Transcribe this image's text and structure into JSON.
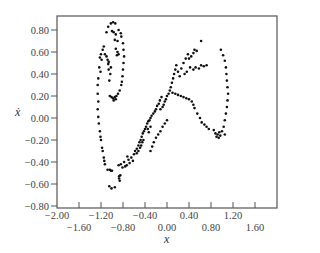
{
  "chart_data": {
    "type": "scatter",
    "title": "",
    "xlabel": "x",
    "ylabel": "ẋ",
    "xlim": [
      -2.0,
      2.0
    ],
    "ylim": [
      -0.8,
      0.9
    ],
    "grid": false,
    "legend": null,
    "x_ticks": [
      -2.0,
      -1.6,
      -1.2,
      -0.8,
      -0.4,
      0.0,
      0.4,
      0.8,
      1.2,
      1.6
    ],
    "x_tick_labels": [
      "−2.00",
      "−1.60",
      "−1.20",
      "−0.80",
      "−0.40",
      "0.00",
      "0.40",
      "0.80",
      "1.20",
      "1.60"
    ],
    "y_ticks": [
      0.8,
      0.6,
      0.4,
      0.2,
      0.0,
      -0.2,
      -0.4,
      -0.6,
      -0.8
    ],
    "y_tick_labels": [
      "0.80",
      "0.60",
      "0.40",
      "0.20",
      "0.00",
      "−0.20",
      "−0.40",
      "−0.60",
      "−0.80"
    ],
    "marker_color": "#111111",
    "series": [
      {
        "name": "phase trajectory",
        "points": [
          [
            -1.02,
            0.86
          ],
          [
            -0.98,
            0.87
          ],
          [
            -0.94,
            0.86
          ],
          [
            -1.07,
            0.83
          ],
          [
            -1.1,
            0.78
          ],
          [
            -1.0,
            0.79
          ],
          [
            -0.97,
            0.78
          ],
          [
            -0.93,
            0.76
          ],
          [
            -0.88,
            0.8
          ],
          [
            -0.84,
            0.77
          ],
          [
            -0.83,
            0.74
          ],
          [
            -0.95,
            0.71
          ],
          [
            -0.9,
            0.7
          ],
          [
            -0.8,
            0.68
          ],
          [
            -0.79,
            0.62
          ],
          [
            -0.78,
            0.56
          ],
          [
            -0.79,
            0.5
          ],
          [
            -0.8,
            0.44
          ],
          [
            -0.81,
            0.38
          ],
          [
            -0.82,
            0.33
          ],
          [
            -0.83,
            0.3
          ],
          [
            -0.86,
            0.25
          ],
          [
            -0.89,
            0.22
          ],
          [
            -0.92,
            0.2
          ],
          [
            -0.95,
            0.19
          ],
          [
            -0.98,
            0.18
          ],
          [
            -1.01,
            0.19
          ],
          [
            -1.04,
            0.2
          ],
          [
            -0.97,
            0.16
          ],
          [
            -0.93,
            0.17
          ],
          [
            -1.05,
            0.34
          ],
          [
            -1.03,
            0.4
          ],
          [
            -1.06,
            0.44
          ],
          [
            -1.02,
            0.46
          ],
          [
            -1.07,
            0.49
          ],
          [
            -0.93,
            0.63
          ],
          [
            -0.9,
            0.6
          ],
          [
            -0.91,
            0.57
          ],
          [
            -0.88,
            0.58
          ],
          [
            -1.13,
            0.58
          ],
          [
            -1.1,
            0.56
          ],
          [
            -1.08,
            0.53
          ],
          [
            -1.06,
            0.51
          ],
          [
            -1.17,
            0.62
          ],
          [
            -1.2,
            0.58
          ],
          [
            -1.22,
            0.55
          ],
          [
            -1.19,
            0.53
          ],
          [
            -1.15,
            0.65
          ],
          [
            -1.23,
            0.46
          ],
          [
            -1.21,
            0.42
          ],
          [
            -1.25,
            0.36
          ],
          [
            -1.26,
            0.3
          ],
          [
            -1.26,
            0.22
          ],
          [
            -1.25,
            0.15
          ],
          [
            -1.26,
            0.08
          ],
          [
            -1.25,
            0.01
          ],
          [
            -1.24,
            -0.05
          ],
          [
            -1.22,
            -0.12
          ],
          [
            -1.21,
            -0.17
          ],
          [
            -1.2,
            -0.2
          ],
          [
            -1.18,
            -0.27
          ],
          [
            -1.17,
            -0.3
          ],
          [
            -1.15,
            -0.36
          ],
          [
            -1.14,
            -0.39
          ],
          [
            -1.13,
            -0.42
          ],
          [
            -1.08,
            -0.47
          ],
          [
            -1.04,
            -0.47
          ],
          [
            -1.02,
            -0.48
          ],
          [
            -1.0,
            -0.48
          ],
          [
            -1.05,
            -0.62
          ],
          [
            -1.01,
            -0.64
          ],
          [
            -0.95,
            -0.63
          ],
          [
            -0.87,
            -0.53
          ],
          [
            -0.87,
            -0.55
          ],
          [
            -0.86,
            -0.57
          ],
          [
            -0.85,
            -0.52
          ],
          [
            -0.88,
            -0.43
          ],
          [
            -0.84,
            -0.42
          ],
          [
            -0.81,
            -0.45
          ],
          [
            -0.78,
            -0.4
          ],
          [
            -0.76,
            -0.44
          ],
          [
            -0.73,
            -0.43
          ],
          [
            -0.7,
            -0.38
          ],
          [
            -0.72,
            -0.35
          ],
          [
            -0.68,
            -0.41
          ],
          [
            -0.65,
            -0.36
          ],
          [
            -0.62,
            -0.39
          ],
          [
            -0.6,
            -0.33
          ],
          [
            -0.58,
            -0.3
          ],
          [
            -0.55,
            -0.28
          ],
          [
            -0.52,
            -0.25
          ],
          [
            -0.5,
            -0.22
          ],
          [
            -0.48,
            -0.2
          ],
          [
            -0.46,
            -0.17
          ],
          [
            -0.44,
            -0.14
          ],
          [
            -0.42,
            -0.12
          ],
          [
            -0.4,
            -0.1
          ],
          [
            -0.55,
            -0.32
          ],
          [
            -0.52,
            -0.3
          ],
          [
            -0.49,
            -0.27
          ],
          [
            -0.47,
            -0.25
          ],
          [
            -0.45,
            -0.22
          ],
          [
            -0.43,
            -0.2
          ],
          [
            -0.38,
            -0.08
          ],
          [
            -0.36,
            -0.05
          ],
          [
            -0.34,
            -0.03
          ],
          [
            -0.32,
            -0.02
          ],
          [
            -0.3,
            0.0
          ],
          [
            -0.28,
            0.02
          ],
          [
            -0.35,
            -0.1
          ],
          [
            -0.33,
            -0.13
          ],
          [
            -0.3,
            -0.08
          ],
          [
            -0.25,
            0.04
          ],
          [
            -0.22,
            0.06
          ],
          [
            -0.2,
            0.08
          ],
          [
            -0.18,
            0.11
          ],
          [
            -0.15,
            0.13
          ],
          [
            -0.13,
            0.16
          ],
          [
            -0.1,
            0.19
          ],
          [
            -0.12,
            0.08
          ],
          [
            -0.08,
            0.1
          ],
          [
            -0.06,
            0.12
          ],
          [
            -0.04,
            0.15
          ],
          [
            -0.02,
            0.17
          ],
          [
            0.0,
            0.2
          ],
          [
            0.03,
            0.22
          ],
          [
            0.05,
            0.25
          ],
          [
            0.07,
            0.28
          ],
          [
            0.09,
            0.32
          ],
          [
            0.11,
            0.36
          ],
          [
            0.13,
            0.4
          ],
          [
            0.15,
            0.44
          ],
          [
            0.17,
            0.48
          ],
          [
            0.2,
            0.42
          ],
          [
            0.23,
            0.38
          ],
          [
            0.26,
            0.45
          ],
          [
            0.3,
            0.5
          ],
          [
            0.34,
            0.54
          ],
          [
            0.38,
            0.58
          ],
          [
            0.4,
            0.54
          ],
          [
            0.44,
            0.56
          ],
          [
            0.48,
            0.59
          ],
          [
            0.54,
            0.61
          ],
          [
            0.62,
            0.7
          ],
          [
            0.5,
            0.62
          ],
          [
            0.32,
            0.4
          ],
          [
            0.36,
            0.42
          ],
          [
            0.42,
            0.46
          ],
          [
            0.48,
            0.44
          ],
          [
            0.52,
            0.46
          ],
          [
            0.58,
            0.45
          ],
          [
            0.62,
            0.48
          ],
          [
            0.67,
            0.47
          ],
          [
            0.72,
            0.48
          ],
          [
            0.1,
            0.23
          ],
          [
            0.15,
            0.22
          ],
          [
            0.2,
            0.21
          ],
          [
            0.25,
            0.2
          ],
          [
            0.3,
            0.19
          ],
          [
            0.35,
            0.18
          ],
          [
            0.4,
            0.17
          ],
          [
            0.45,
            0.15
          ],
          [
            0.48,
            0.12
          ],
          [
            0.5,
            0.09
          ],
          [
            0.55,
            0.04
          ],
          [
            0.6,
            0.0
          ],
          [
            0.63,
            -0.04
          ],
          [
            0.68,
            -0.06
          ],
          [
            0.72,
            -0.08
          ],
          [
            0.76,
            -0.1
          ],
          [
            0.85,
            -0.11
          ],
          [
            0.88,
            -0.14
          ],
          [
            0.92,
            -0.15
          ],
          [
            0.95,
            -0.13
          ],
          [
            0.9,
            -0.17
          ],
          [
            0.94,
            -0.18
          ],
          [
            0.97,
            -0.16
          ],
          [
            1.0,
            -0.12
          ],
          [
            1.05,
            -0.15
          ],
          [
            0.98,
            0.62
          ],
          [
            1.02,
            0.57
          ],
          [
            1.05,
            0.52
          ],
          [
            1.07,
            0.46
          ],
          [
            1.08,
            0.4
          ],
          [
            1.09,
            0.34
          ],
          [
            1.1,
            0.28
          ],
          [
            1.11,
            0.22
          ],
          [
            1.1,
            0.16
          ],
          [
            1.09,
            0.1
          ],
          [
            1.07,
            0.04
          ],
          [
            1.05,
            -0.02
          ],
          [
            1.03,
            -0.08
          ],
          [
            0.0,
            -0.02
          ],
          [
            -0.04,
            -0.05
          ],
          [
            -0.08,
            -0.08
          ],
          [
            -0.12,
            -0.12
          ],
          [
            -0.16,
            -0.15
          ],
          [
            -0.2,
            -0.18
          ],
          [
            -0.24,
            -0.22
          ],
          [
            -0.27,
            -0.26
          ],
          [
            -0.3,
            -0.3
          ]
        ]
      }
    ]
  },
  "axes": {
    "x_label": "x",
    "y_label": "ẋ"
  }
}
